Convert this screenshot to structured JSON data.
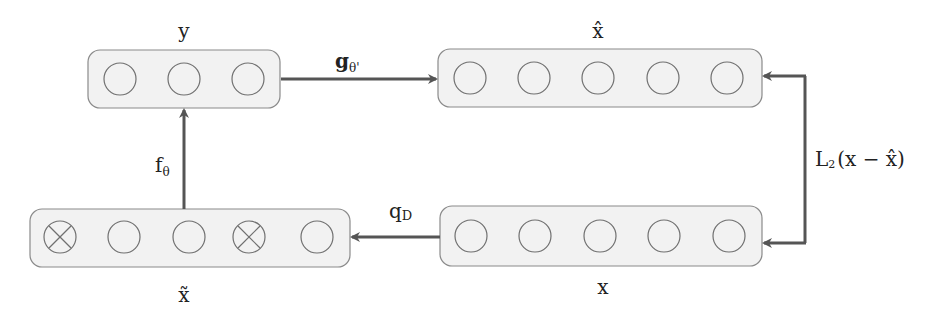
{
  "diagram": {
    "type": "denoising-autoencoder",
    "colors": {
      "box_fill": "#f2f2f2",
      "box_stroke": "#8a8a8a",
      "node_stroke": "#707070",
      "arrow": "#555555",
      "text": "#222222"
    },
    "layers": [
      {
        "id": "y",
        "label": "y",
        "nodes": [
          "o",
          "o",
          "o"
        ]
      },
      {
        "id": "x_hat",
        "label": "x̂",
        "nodes": [
          "o",
          "o",
          "o",
          "o",
          "o"
        ]
      },
      {
        "id": "x",
        "label": "x",
        "nodes": [
          "o",
          "o",
          "o",
          "o",
          "o"
        ]
      },
      {
        "id": "x_tilde",
        "label": "x̃",
        "nodes": [
          "x",
          "o",
          "o",
          "x",
          "o"
        ]
      }
    ],
    "edges": [
      {
        "from": "x",
        "to": "x_tilde",
        "label_main": "q",
        "label_sub": "D"
      },
      {
        "from": "x_tilde",
        "to": "y",
        "label_main": "f",
        "label_sub": "θ"
      },
      {
        "from": "y",
        "to": "x_hat",
        "label_main": "g",
        "label_sub": "θ'"
      },
      {
        "from": "x",
        "to": "x_hat",
        "label_main": "L",
        "label_sub": "2",
        "label_rest": "(x − x̂)",
        "bidirectional": true
      }
    ]
  }
}
